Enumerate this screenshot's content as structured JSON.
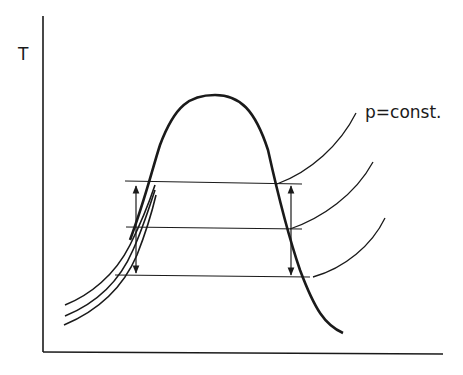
{
  "diagram": {
    "type": "T-s diagram with saturation dome and isobars",
    "y_axis_label": "T",
    "x_axis_label": "",
    "isobar_label": "p=const.",
    "colors": {
      "ink": "#1a1a1a",
      "background": "#ffffff"
    },
    "isobar_count": 3,
    "horizontal_lines": 3,
    "arrows": [
      "left-temperature-difference",
      "right-temperature-difference"
    ]
  }
}
